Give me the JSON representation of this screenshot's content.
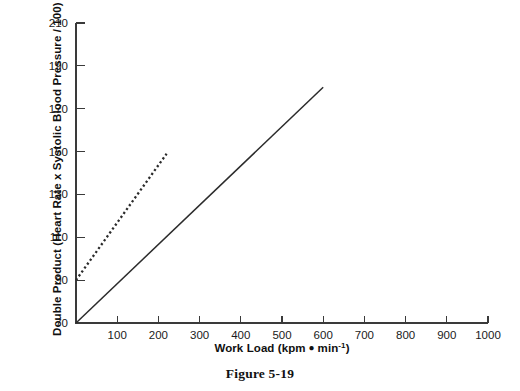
{
  "figure": {
    "caption": "Figure 5-19"
  },
  "chart_data": {
    "type": "line",
    "title": "",
    "xlabel_full": "Work Load (kpm • min⁻¹)",
    "xlabel_main": "Work Load (kpm",
    "xlabel_unit_tail": "min",
    "xlabel_exponent": "-1",
    "xlabel_close": ")",
    "ylabel": "Double Product (Heart Rate x Systolic Blood Pressure / 100)",
    "xlim": [
      0,
      1000
    ],
    "ylim": [
      70,
      210
    ],
    "xticks": [
      100,
      200,
      300,
      400,
      500,
      600,
      700,
      800,
      900,
      1000
    ],
    "yticks": [
      70,
      90,
      110,
      130,
      150,
      170,
      190,
      210
    ],
    "xtick_labels": [
      "100",
      "200",
      "300",
      "400",
      "500",
      "600",
      "700",
      "800",
      "900",
      "1000"
    ],
    "ytick_labels": [
      "70",
      "90",
      "110",
      "130",
      "150",
      "170",
      "190",
      "210"
    ],
    "grid": false,
    "legend": "none",
    "tick_direction": "in",
    "series": [
      {
        "name": "lower-slope-solid-line",
        "style": "solid",
        "color": "#2b2b2b",
        "x": [
          0,
          600
        ],
        "y": [
          70,
          180
        ]
      },
      {
        "name": "steeper-dotted-line",
        "style": "dotted",
        "color": "#2b2b2b",
        "x": [
          0,
          220
        ],
        "y": [
          90,
          149
        ]
      }
    ]
  }
}
